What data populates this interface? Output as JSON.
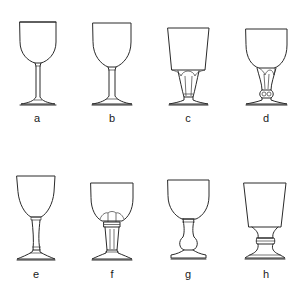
{
  "figure": {
    "line_color": "#2a2a2a",
    "background": "#ffffff",
    "glasses": [
      {
        "label": "a",
        "shape": "round bowl, thin straight stem, flat conical foot"
      },
      {
        "label": "b",
        "shape": "round bowl, short straight stem with collar, flat conical foot"
      },
      {
        "label": "c",
        "shape": "tapered straight-sided bowl, fluted/facet-cut stem, conical foot"
      },
      {
        "label": "d",
        "shape": "U-shaped bowl, fluted stem with knop at base, conical foot"
      },
      {
        "label": "e",
        "shape": "ovoid bowl, waisted stem with collar rings, conical foot"
      },
      {
        "label": "f",
        "shape": "bucket bowl with lobed base, faceted stem with ring collar, conical foot"
      },
      {
        "label": "g",
        "shape": "round bowl, baluster stem with bulb, domed foot"
      },
      {
        "label": "h",
        "shape": "flared bucket bowl, short waisted stem with central ring, domed foot"
      }
    ]
  }
}
